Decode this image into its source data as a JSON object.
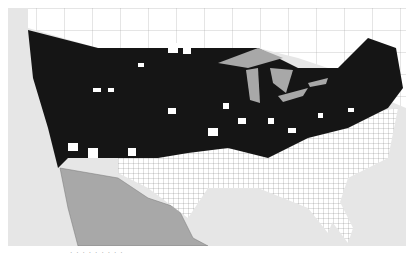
{
  "map": {
    "title": "US county map",
    "colors": {
      "ocean": "#e6e6e6",
      "neighbor_land": "#a8a8a8",
      "lakes": "#a8a8a8",
      "canada": "#ffffff",
      "filled_counties": "#151515",
      "unfilled_counties": "#ffffff",
      "borders": "#555555"
    },
    "regions": [
      "Canada",
      "United States",
      "Mexico",
      "Great Lakes",
      "Pacific Ocean",
      "Gulf of Mexico",
      "Atlantic Ocean"
    ]
  },
  "caption": "· · ·  · ·    · ·  · ·"
}
